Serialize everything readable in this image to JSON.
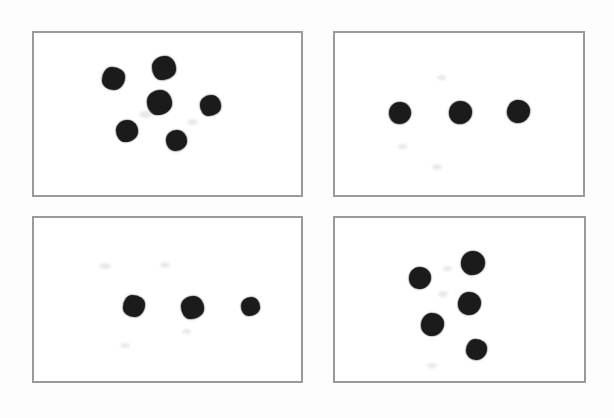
{
  "document": {
    "title": "Dot Pattern Panels",
    "background_color": "#fdfdfd",
    "panel_fill_color": "#ffffff",
    "panel_border_color": "#9a9a9a",
    "dot_color": "#1b1b1b",
    "panel_count": 4,
    "dot_diameter_px": 20
  },
  "chart_data": {
    "type": "scatter",
    "xlabel": "",
    "ylabel": "",
    "grid": false,
    "legend": "none",
    "axis_ticks": false,
    "panel_layout": {
      "rows": 2,
      "columns": 2
    },
    "panels": [
      {
        "id": "panel-1",
        "position": "top-left",
        "dot_count": 6,
        "frame": {
          "x": 32,
          "y": 31,
          "width": 271,
          "height": 166
        },
        "dots": [
          {
            "cx": 113,
            "cy": 78,
            "d": 23
          },
          {
            "cx": 164,
            "cy": 68,
            "d": 24
          },
          {
            "cx": 159,
            "cy": 102,
            "d": 25
          },
          {
            "cx": 210,
            "cy": 105,
            "d": 21
          },
          {
            "cx": 127,
            "cy": 131,
            "d": 22
          },
          {
            "cx": 176,
            "cy": 140,
            "d": 21
          }
        ]
      },
      {
        "id": "panel-2",
        "position": "top-right",
        "dot_count": 3,
        "frame": {
          "x": 333,
          "y": 31,
          "width": 252,
          "height": 166
        },
        "dots": [
          {
            "cx": 400,
            "cy": 113,
            "d": 22
          },
          {
            "cx": 460,
            "cy": 112,
            "d": 23
          },
          {
            "cx": 518,
            "cy": 111,
            "d": 23
          }
        ]
      },
      {
        "id": "panel-3",
        "position": "bottom-left",
        "dot_count": 3,
        "frame": {
          "x": 32,
          "y": 216,
          "width": 271,
          "height": 167
        },
        "dots": [
          {
            "cx": 134,
            "cy": 306,
            "d": 22
          },
          {
            "cx": 192,
            "cy": 307,
            "d": 23
          },
          {
            "cx": 250,
            "cy": 306,
            "d": 19
          }
        ]
      },
      {
        "id": "panel-4",
        "position": "bottom-right",
        "dot_count": 5,
        "frame": {
          "x": 333,
          "y": 216,
          "width": 253,
          "height": 167
        },
        "dots": [
          {
            "cx": 473,
            "cy": 263,
            "d": 24
          },
          {
            "cx": 420,
            "cy": 278,
            "d": 22
          },
          {
            "cx": 469,
            "cy": 303,
            "d": 23
          },
          {
            "cx": 432,
            "cy": 324,
            "d": 23
          },
          {
            "cx": 476,
            "cy": 349,
            "d": 21
          }
        ]
      }
    ],
    "smudges": [
      {
        "cx": 145,
        "cy": 114,
        "w": 13,
        "h": 7
      },
      {
        "cx": 192,
        "cy": 122,
        "w": 11,
        "h": 6
      },
      {
        "cx": 437,
        "cy": 167,
        "w": 10,
        "h": 6
      },
      {
        "cx": 441,
        "cy": 77,
        "w": 9,
        "h": 5
      },
      {
        "cx": 402,
        "cy": 146,
        "w": 9,
        "h": 5
      },
      {
        "cx": 105,
        "cy": 266,
        "w": 12,
        "h": 6
      },
      {
        "cx": 165,
        "cy": 265,
        "w": 10,
        "h": 6
      },
      {
        "cx": 125,
        "cy": 345,
        "w": 10,
        "h": 5
      },
      {
        "cx": 186,
        "cy": 331,
        "w": 9,
        "h": 5
      },
      {
        "cx": 443,
        "cy": 294,
        "w": 10,
        "h": 6
      },
      {
        "cx": 447,
        "cy": 268,
        "w": 9,
        "h": 5
      },
      {
        "cx": 432,
        "cy": 365,
        "w": 10,
        "h": 5
      }
    ]
  }
}
